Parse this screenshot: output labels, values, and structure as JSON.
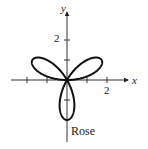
{
  "chart_data": {
    "type": "line",
    "title": "",
    "caption": "Rose",
    "equation_form": "polar rose, 3 petals (r = 2 sin 3θ)",
    "xlabel": "x",
    "ylabel": "y",
    "x_tick_labels": [
      "2"
    ],
    "y_tick_labels": [
      "2"
    ],
    "xlim": [
      -3,
      3
    ],
    "ylim": [
      -3,
      3
    ],
    "grid": false,
    "legend": "none",
    "petals": [
      {
        "angle_deg": 30,
        "length": 2
      },
      {
        "angle_deg": 150,
        "length": 2
      },
      {
        "angle_deg": 270,
        "length": 2
      }
    ]
  },
  "labels": {
    "x_axis": "x",
    "y_axis": "y",
    "x_tick": "2",
    "y_tick": "2",
    "caption": "Rose"
  }
}
